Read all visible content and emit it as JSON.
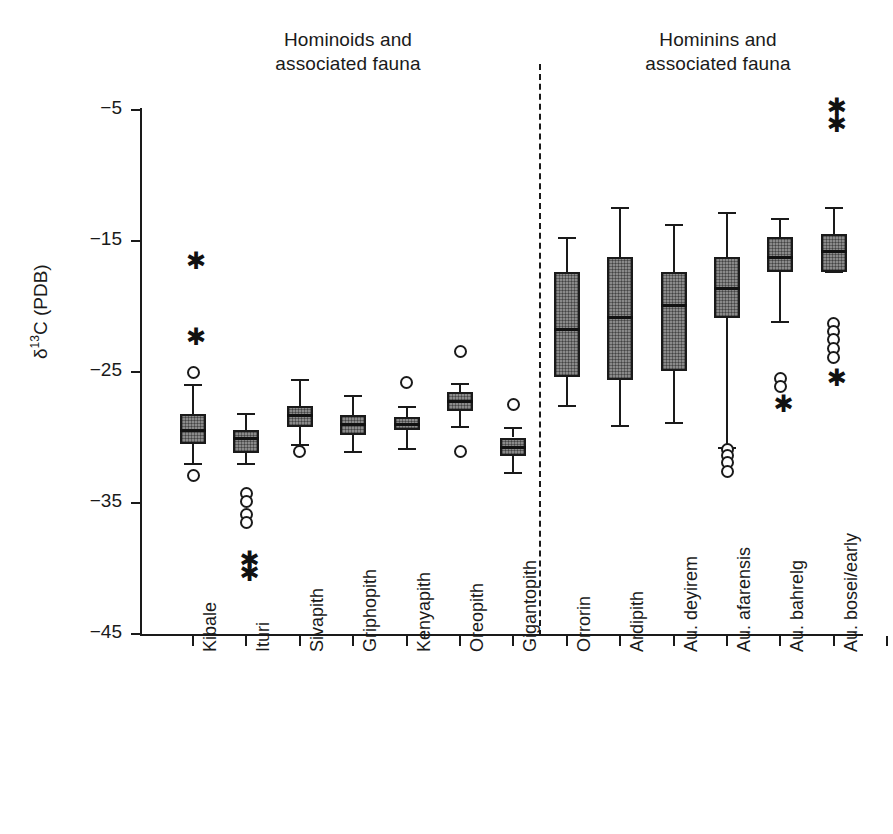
{
  "figure": {
    "group_titles": {
      "left": "Hominoids and associated fauna",
      "left_line1": "Hominoids and",
      "left_line2": "associated fauna",
      "right": "Hominins and associated fauna",
      "right_line1": "Hominins and",
      "right_line2": "associated fauna"
    },
    "y_axis_label_prefix": "δ",
    "y_axis_label_sup": "13",
    "y_axis_label_suffix": "C (PDB)"
  },
  "chart_data": {
    "type": "box",
    "title": "",
    "xlabel": "",
    "ylabel": "δ13C (PDB)",
    "ylim": [
      -45,
      -5
    ],
    "yticks": [
      -5,
      -15,
      -25,
      -35,
      -45
    ],
    "ytick_labels": [
      "−5",
      "−15",
      "−25",
      "−35",
      "−45"
    ],
    "grid": false,
    "legend": "none",
    "divider_after_category": "Gigantopith",
    "annotations": [
      {
        "text": "Hominoids and associated fauna",
        "position": "top-left-group"
      },
      {
        "text": "Hominins and associated fauna",
        "position": "top-right-group"
      }
    ],
    "categories": [
      "Kibale",
      "Ituri",
      "Sivapith",
      "Griphopith",
      "Kenyapith",
      "Oreopith",
      "Gigantopith",
      "Orrorin",
      "Ardipith",
      "Au. deyirem",
      "Au. afarensis",
      "Au. bahrelg",
      "Au. bosei/early Homo"
    ],
    "boxes": [
      {
        "category": "Kibale",
        "group": "hominoids",
        "whisker_high": -26.0,
        "q3": -28.2,
        "median": -29.4,
        "q1": -30.5,
        "whisker_low": -32.0,
        "outliers": [
          -25.0,
          -32.9
        ],
        "extremes": [
          -16.4,
          -22.2
        ]
      },
      {
        "category": "Ituri",
        "group": "hominoids",
        "whisker_high": -28.2,
        "q3": -29.4,
        "median": -30.0,
        "q1": -31.2,
        "whisker_low": -32.0,
        "outliers": [
          -34.3,
          -34.9,
          -35.9,
          -36.5
        ],
        "extremes": [
          -39.2,
          -40.2
        ]
      },
      {
        "category": "Sivapith",
        "group": "hominoids",
        "whisker_high": -25.6,
        "q3": -27.6,
        "median": -28.3,
        "q1": -29.2,
        "whisker_low": -30.6,
        "outliers": [
          -31.1
        ],
        "extremes": []
      },
      {
        "category": "Griphopith",
        "group": "hominoids",
        "whisker_high": -26.8,
        "q3": -28.3,
        "median": -29.0,
        "q1": -29.8,
        "whisker_low": -31.1,
        "outliers": [],
        "extremes": []
      },
      {
        "category": "Kenyapith",
        "group": "hominoids",
        "whisker_high": -27.7,
        "q3": -28.4,
        "median": -29.0,
        "q1": -29.4,
        "whisker_low": -30.9,
        "outliers": [
          -25.8
        ],
        "extremes": []
      },
      {
        "category": "Oreopith",
        "group": "hominoids",
        "whisker_high": -25.9,
        "q3": -26.5,
        "median": -27.2,
        "q1": -28.0,
        "whisker_low": -29.2,
        "outliers": [
          -23.4,
          -31.1
        ],
        "extremes": []
      },
      {
        "category": "Gigantopith",
        "group": "hominoids",
        "whisker_high": -29.3,
        "q3": -30.0,
        "median": -30.7,
        "q1": -31.4,
        "whisker_low": -32.7,
        "outliers": [
          -27.5
        ],
        "extremes": []
      },
      {
        "category": "Orrorin",
        "group": "hominins",
        "whisker_high": -14.8,
        "q3": -17.4,
        "median": -21.7,
        "q1": -25.4,
        "whisker_low": -27.6,
        "outliers": [],
        "extremes": []
      },
      {
        "category": "Ardipith",
        "group": "hominins",
        "whisker_high": -12.5,
        "q3": -16.2,
        "median": -20.8,
        "q1": -25.6,
        "whisker_low": -29.1,
        "outliers": [],
        "extremes": []
      },
      {
        "category": "Au. deyirem",
        "group": "hominins",
        "whisker_high": -13.8,
        "q3": -17.4,
        "median": -19.9,
        "q1": -24.9,
        "whisker_low": -28.9,
        "outliers": [],
        "extremes": []
      },
      {
        "category": "Au. afarensis",
        "group": "hominins",
        "whisker_high": -12.9,
        "q3": -16.2,
        "median": -18.6,
        "q1": -20.9,
        "whisker_low": -30.8,
        "outliers": [
          -30.9,
          -31.4,
          -31.9,
          -32.6
        ],
        "extremes": []
      },
      {
        "category": "Au. bahrelg",
        "group": "hominins",
        "whisker_high": -13.3,
        "q3": -14.7,
        "median": -16.2,
        "q1": -17.4,
        "whisker_low": -21.2,
        "outliers": [
          -25.5,
          -26.1
        ],
        "extremes": [
          -27.3
        ]
      },
      {
        "category": "Au. bosei/early Homo",
        "group": "hominins",
        "whisker_high": -12.5,
        "q3": -14.5,
        "median": -15.8,
        "q1": -17.4,
        "whisker_low": -17.4,
        "outliers": [
          -21.3,
          -21.9,
          -22.5,
          -23.2,
          -23.9
        ],
        "extremes": [
          -25.3,
          -4.6,
          -5.9
        ]
      }
    ]
  },
  "x_labels": [
    {
      "text": "Kibale"
    },
    {
      "text": "Ituri"
    },
    {
      "text": "Sivapith"
    },
    {
      "text": "Griphopith"
    },
    {
      "text": "Kenyapith"
    },
    {
      "text": "Oreopith"
    },
    {
      "text": "Gigantopith"
    },
    {
      "text": "Orrorin"
    },
    {
      "text": "Ardipith"
    },
    {
      "text": "Au. deyirem"
    },
    {
      "text": "Au. afarensis"
    },
    {
      "text": "Au. bahrelg"
    },
    {
      "text": "Au. bosei/early"
    },
    {
      "text": "Homo"
    }
  ],
  "colors": {
    "ink": "#1a1a1a",
    "box_fill": "#8a8a8a",
    "background": "#ffffff"
  }
}
